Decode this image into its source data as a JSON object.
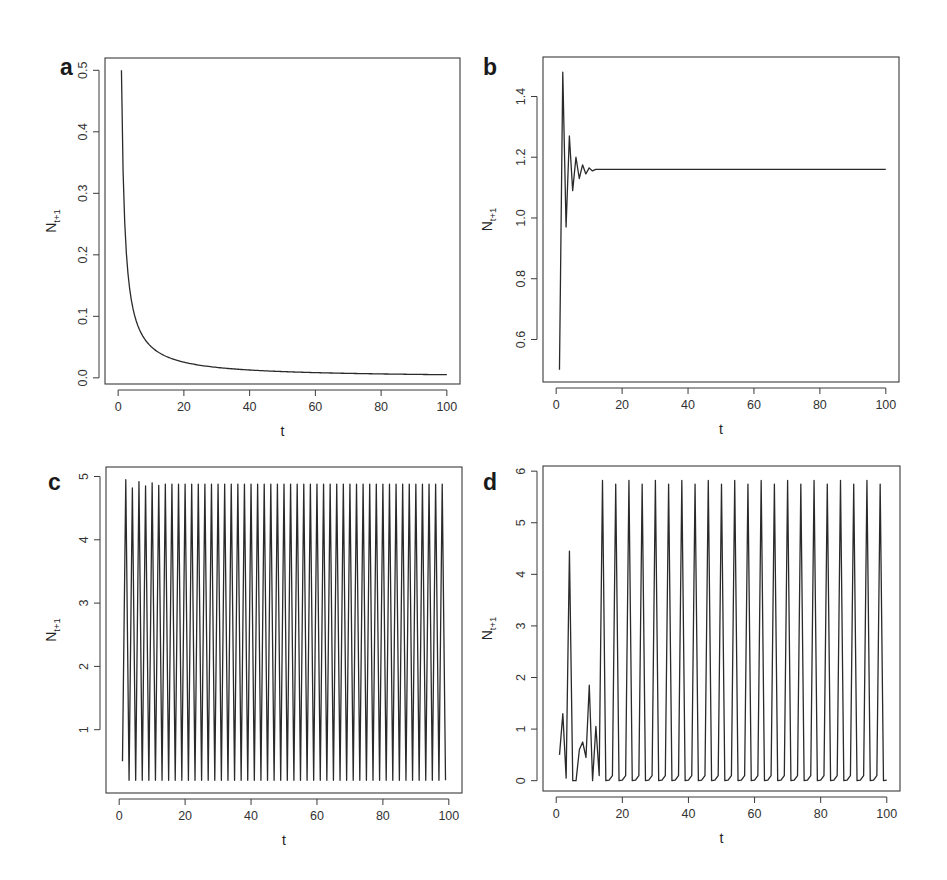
{
  "figure": {
    "panels": [
      "a",
      "b",
      "c",
      "d"
    ],
    "line_color": "#2a2a2a",
    "frame_color": "#3a3a3a",
    "background": "#ffffff"
  },
  "chart_data": [
    {
      "panel": "a",
      "type": "line",
      "title": "",
      "xlabel": "t",
      "ylabel": "N",
      "ylabel_subscript": "t+1",
      "xlim": [
        -4,
        104
      ],
      "ylim": [
        -0.01,
        0.52
      ],
      "x_ticks": [
        0,
        20,
        40,
        60,
        80,
        100
      ],
      "y_ticks": [
        0.0,
        0.1,
        0.2,
        0.3,
        0.4,
        0.5
      ],
      "x_tick_labels": [
        "0",
        "20",
        "40",
        "60",
        "80",
        "100"
      ],
      "y_tick_labels": [
        "0.0",
        "0.1",
        "0.2",
        "0.3",
        "0.4",
        "0.5"
      ],
      "grid": false,
      "legend": null,
      "description": "Monotonic decay toward zero",
      "x": [
        1,
        2,
        3,
        4,
        5,
        6,
        8,
        10,
        12,
        15,
        20,
        25,
        30,
        40,
        50,
        60,
        70,
        80,
        90,
        100
      ],
      "values": [
        0.5,
        0.333,
        0.25,
        0.2,
        0.167,
        0.143,
        0.111,
        0.091,
        0.077,
        0.0625,
        0.0476,
        0.0385,
        0.0323,
        0.0244,
        0.0196,
        0.0164,
        0.0141,
        0.0123,
        0.011,
        0.0099
      ]
    },
    {
      "panel": "b",
      "type": "line",
      "title": "",
      "xlabel": "t",
      "ylabel": "N",
      "ylabel_subscript": "t+1",
      "xlim": [
        -4,
        104
      ],
      "ylim": [
        0.46,
        1.53
      ],
      "x_ticks": [
        0,
        20,
        40,
        60,
        80,
        100
      ],
      "y_ticks": [
        0.6,
        0.8,
        1.0,
        1.2,
        1.4
      ],
      "x_tick_labels": [
        "0",
        "20",
        "40",
        "60",
        "80",
        "100"
      ],
      "y_tick_labels": [
        "0.6",
        "0.8",
        "1.0",
        "1.2",
        "1.4"
      ],
      "grid": false,
      "legend": null,
      "description": "Damped oscillation converging to stable equilibrium ~1.16",
      "x": [
        1,
        2,
        3,
        4,
        5,
        6,
        7,
        8,
        9,
        10,
        11,
        12,
        13,
        100
      ],
      "values": [
        0.5,
        1.48,
        0.97,
        1.27,
        1.09,
        1.2,
        1.13,
        1.175,
        1.145,
        1.165,
        1.155,
        1.16,
        1.16,
        1.16
      ]
    },
    {
      "panel": "c",
      "type": "line",
      "title": "",
      "xlabel": "t",
      "ylabel": "N",
      "ylabel_subscript": "t+1",
      "xlim": [
        -4,
        104
      ],
      "ylim": [
        0.0,
        5.15
      ],
      "x_ticks": [
        0,
        20,
        40,
        60,
        80,
        100
      ],
      "y_ticks": [
        1,
        2,
        3,
        4,
        5
      ],
      "x_tick_labels": [
        "0",
        "20",
        "40",
        "60",
        "80",
        "100"
      ],
      "y_tick_labels": [
        "1",
        "2",
        "3",
        "4",
        "5"
      ],
      "grid": false,
      "legend": null,
      "description": "Stable 2-point limit cycle: alternates between ~4.88 and ~0.2 every time step",
      "start": {
        "t": 1,
        "value": 0.5
      },
      "period": 2,
      "early_peaks": [
        4.95,
        4.82,
        4.92,
        4.85,
        4.9,
        4.86
      ],
      "steady_peak": 4.88,
      "trough": 0.2,
      "t_range": [
        1,
        99
      ]
    },
    {
      "panel": "d",
      "type": "line",
      "title": "",
      "xlabel": "t",
      "ylabel": "N",
      "ylabel_subscript": "t+1",
      "xlim": [
        -4,
        104
      ],
      "ylim": [
        -0.2,
        6.1
      ],
      "x_ticks": [
        0,
        20,
        40,
        60,
        80,
        100
      ],
      "y_ticks": [
        0,
        1,
        2,
        3,
        4,
        5,
        6
      ],
      "x_tick_labels": [
        "0",
        "20",
        "40",
        "60",
        "80",
        "100"
      ],
      "y_tick_labels": [
        "0",
        "1",
        "2",
        "3",
        "4",
        "5",
        "6"
      ],
      "grid": false,
      "legend": null,
      "description": "Chaotic-looking transient then 4-point cycle with spikes ~5.8",
      "transient": {
        "x": [
          1,
          2,
          3,
          4,
          5,
          6,
          7,
          8,
          9,
          10,
          11,
          12,
          13
        ],
        "values": [
          0.5,
          1.3,
          0.05,
          4.45,
          0.0,
          0.0,
          0.6,
          0.75,
          0.45,
          1.85,
          0.0,
          1.05,
          0.1
        ]
      },
      "cycle": {
        "start_t": 14,
        "period": 4,
        "pattern": [
          5.8,
          0.0,
          0.01,
          0.1
        ],
        "peak_alternates": [
          5.82,
          5.75
        ],
        "end_t": 100
      }
    }
  ]
}
